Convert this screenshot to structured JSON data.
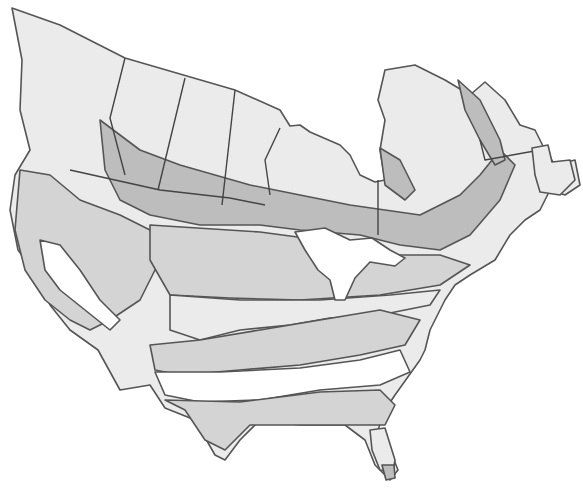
{
  "map": {
    "type": "zone-map",
    "region": "North America (Canada and contiguous United States)",
    "zone_shades": [
      "#ffffff",
      "#ebebeb",
      "#d4d4d4",
      "#bdbdbd",
      "#a8a8a8"
    ],
    "outline_color": "#555555",
    "text_labels": []
  }
}
